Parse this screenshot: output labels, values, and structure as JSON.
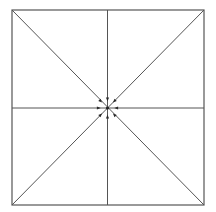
{
  "diagram": {
    "type": "square-with-midlines-and-diagonals",
    "colors": {
      "background": "#ffffff",
      "line": "#555555",
      "marker": "#2a2a2a"
    },
    "frame": {
      "x1": 12,
      "y1": 10,
      "x2": 204,
      "y2": 205
    },
    "center": {
      "x": 107.5,
      "y": 108
    },
    "lines": [
      {
        "id": "vertical-midline",
        "x1": 107.5,
        "y1": 10,
        "x2": 107.5,
        "y2": 205
      },
      {
        "id": "horizontal-midline",
        "x1": 12,
        "y1": 108,
        "x2": 204,
        "y2": 108
      },
      {
        "id": "diagonal-tl-br",
        "x1": 12,
        "y1": 10,
        "x2": 204,
        "y2": 205
      },
      {
        "id": "diagonal-tr-bl",
        "x1": 204,
        "y1": 10,
        "x2": 12,
        "y2": 205
      }
    ],
    "markers": [
      {
        "id": "marker-n",
        "direction": "n",
        "dx": 0,
        "dy": -9
      },
      {
        "id": "marker-s",
        "direction": "s",
        "dx": 0,
        "dy": 9
      },
      {
        "id": "marker-e",
        "direction": "e",
        "dx": 9,
        "dy": 0
      },
      {
        "id": "marker-w",
        "direction": "w",
        "dx": -9,
        "dy": 0
      },
      {
        "id": "marker-ne",
        "direction": "ne",
        "dx": 7,
        "dy": -7
      },
      {
        "id": "marker-nw",
        "direction": "nw",
        "dx": -7,
        "dy": -7
      },
      {
        "id": "marker-se",
        "direction": "se",
        "dx": 7,
        "dy": 7
      },
      {
        "id": "marker-sw",
        "direction": "sw",
        "dx": -7,
        "dy": 7
      }
    ]
  }
}
